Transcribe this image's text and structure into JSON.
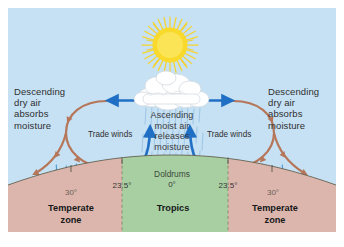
{
  "figure": {
    "colors": {
      "sky": "#c6e1f3",
      "border": "#ffffff",
      "earth_temperate": "#dcb6ac",
      "earth_tropics": "#a8cfa2",
      "circulation_arrow": "#b5765a",
      "wind_arrow": "#1f6fc4",
      "rain": "#7fb4dd",
      "sun": "#f7d62e",
      "cloud": "#ffffff",
      "moisture_squiggle": "#4f97cf",
      "dashed_boundary": "#8a8a6e"
    }
  },
  "sun": {
    "name": "sun"
  },
  "cloud": {
    "name": "cumulus-cloud"
  },
  "labels": {
    "descending_left": "Descending\ndry air\nabsorbs\nmoisture",
    "descending_right": "Descending\ndry air\nabsorbs\nmoisture",
    "trade_winds_left": "Trade winds",
    "trade_winds_right": "Trade winds",
    "ascending_center": "Ascending\nmoist air\nreleases\nmoisture",
    "doldrums": "Doldrums"
  },
  "latitudes": [
    {
      "id": "lat-30-left",
      "text": "30°",
      "style": "outer"
    },
    {
      "id": "lat-235-left",
      "text": "23.5°",
      "style": "inner"
    },
    {
      "id": "lat-0",
      "text": "0°",
      "style": "inner"
    },
    {
      "id": "lat-235-right",
      "text": "23.5°",
      "style": "inner"
    },
    {
      "id": "lat-30-right",
      "text": "30°",
      "style": "outer"
    }
  ],
  "zones": {
    "temperate_left": "Temperate\nzone",
    "tropics": "Tropics",
    "temperate_right": "Temperate\nzone"
  }
}
